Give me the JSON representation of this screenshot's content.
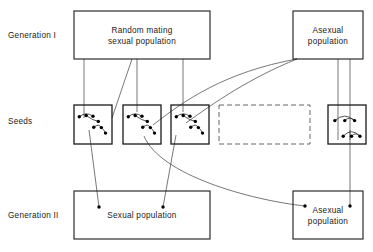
{
  "diagram": {
    "row_labels": [
      {
        "id": "generation-i",
        "text": "Generation I",
        "x": 8,
        "y": 38
      },
      {
        "id": "seeds",
        "text": "Seeds",
        "x": 8,
        "y": 124
      },
      {
        "id": "generation-ii",
        "text": "Generation II",
        "x": 8,
        "y": 218
      }
    ],
    "boxes": [
      {
        "id": "random-mating-sexual-population",
        "x": 74,
        "y": 11,
        "w": 136,
        "h": 48,
        "lines": [
          "Random mating",
          "sexual population"
        ],
        "style": "solid"
      },
      {
        "id": "asexual-population-gen1",
        "x": 293,
        "y": 11,
        "w": 70,
        "h": 48,
        "lines": [
          "Asexual",
          "population"
        ],
        "style": "solid"
      },
      {
        "id": "empty-seed-placeholder",
        "x": 219,
        "y": 105,
        "w": 91,
        "h": 39,
        "lines": [],
        "style": "dashed"
      },
      {
        "id": "sexual-population-gen2",
        "x": 74,
        "y": 191,
        "w": 136,
        "h": 48,
        "lines": [
          "Sexual population"
        ],
        "style": "solid"
      },
      {
        "id": "asexual-population-gen2",
        "x": 293,
        "y": 191,
        "w": 70,
        "h": 48,
        "lines": [
          "Asexual",
          "population"
        ],
        "style": "solid"
      }
    ],
    "seed_boxes": [
      {
        "id": "seed-box-1",
        "x": 74,
        "y": 105,
        "w": 38,
        "h": 39,
        "pattern": "sexual"
      },
      {
        "id": "seed-box-2",
        "x": 123,
        "y": 105,
        "w": 38,
        "h": 39,
        "pattern": "sexual"
      },
      {
        "id": "seed-box-3",
        "x": 171,
        "y": 105,
        "w": 38,
        "h": 39,
        "pattern": "sexual"
      },
      {
        "id": "seed-box-4",
        "x": 328,
        "y": 105,
        "w": 38,
        "h": 39,
        "pattern": "asexual"
      }
    ],
    "seed_patterns": {
      "sexual": {
        "dots": [
          [
            0.14,
            0.3
          ],
          [
            0.32,
            0.27
          ],
          [
            0.5,
            0.29
          ],
          [
            0.64,
            0.42
          ],
          [
            0.52,
            0.57
          ],
          [
            0.72,
            0.58
          ],
          [
            0.83,
            0.72
          ]
        ],
        "branches": [
          [
            [
              0.14,
              0.3
            ],
            [
              0.32,
              0.16
            ],
            [
              0.5,
              0.29
            ]
          ],
          [
            [
              0.32,
              0.27
            ],
            [
              0.5,
              0.4
            ],
            [
              0.64,
              0.42
            ]
          ],
          [
            [
              0.52,
              0.57
            ],
            [
              0.66,
              0.46
            ],
            [
              0.72,
              0.58
            ]
          ],
          [
            [
              0.72,
              0.58
            ],
            [
              0.8,
              0.64
            ],
            [
              0.83,
              0.72
            ]
          ]
        ]
      },
      "asexual": {
        "dots": [
          [
            0.18,
            0.4
          ],
          [
            0.44,
            0.4
          ],
          [
            0.7,
            0.4
          ],
          [
            0.4,
            0.8
          ],
          [
            0.62,
            0.8
          ],
          [
            0.84,
            0.8
          ]
        ],
        "branches": [
          [
            [
              0.18,
              0.4
            ],
            [
              0.44,
              0.17
            ],
            [
              0.7,
              0.4
            ]
          ],
          [
            [
              0.44,
              0.4
            ],
            [
              0.57,
              0.28
            ],
            [
              0.7,
              0.4
            ]
          ],
          [
            [
              0.4,
              0.8
            ],
            [
              0.62,
              0.57
            ],
            [
              0.84,
              0.8
            ]
          ],
          [
            [
              0.62,
              0.8
            ],
            [
              0.73,
              0.68
            ],
            [
              0.84,
              0.8
            ]
          ]
        ]
      }
    },
    "connectors": [
      {
        "id": "gen1-sexual-to-seed1",
        "kind": "line",
        "from": [
          84,
          59
        ],
        "to": [
          84,
          118
        ]
      },
      {
        "id": "gen1-sexual-to-seed2-diagonal",
        "kind": "line",
        "from": [
          132,
          59
        ],
        "to": [
          112,
          118
        ]
      },
      {
        "id": "gen1-sexual-to-seed2",
        "kind": "line",
        "from": [
          137,
          59
        ],
        "to": [
          137,
          112
        ]
      },
      {
        "id": "gen1-sexual-to-seed3",
        "kind": "line",
        "from": [
          183,
          59
        ],
        "to": [
          183,
          112
        ]
      },
      {
        "id": "gen1-asexual-to-seed2-curve",
        "kind": "curve",
        "from": [
          297,
          59
        ],
        "c1": [
          225,
          72
        ],
        "c2": [
          185,
          100
        ],
        "to": [
          153,
          125
        ]
      },
      {
        "id": "gen1-asexual-to-seed3-curve",
        "kind": "curve",
        "from": [
          297,
          59
        ],
        "c1": [
          250,
          78
        ],
        "c2": [
          215,
          102
        ],
        "to": [
          186,
          123
        ]
      },
      {
        "id": "gen1-asexual-to-seed4-left",
        "kind": "line",
        "from": [
          338,
          59
        ],
        "to": [
          338,
          140
        ]
      },
      {
        "id": "gen1-asexual-to-seed4-right",
        "kind": "line",
        "from": [
          350,
          59
        ],
        "to": [
          350,
          140
        ]
      },
      {
        "id": "seed1-to-gen2-sexual",
        "kind": "line",
        "from": [
          89,
          130
        ],
        "to": [
          99,
          207
        ]
      },
      {
        "id": "seed3-to-gen2-sexual",
        "kind": "line",
        "from": [
          176,
          135
        ],
        "to": [
          163,
          207
        ]
      },
      {
        "id": "seed2-to-gen2-asexual-curve",
        "kind": "curve",
        "from": [
          144,
          136
        ],
        "c1": [
          160,
          175
        ],
        "c2": [
          250,
          200
        ],
        "to": [
          305,
          206
        ]
      },
      {
        "id": "seed4-to-gen2-asexual",
        "kind": "line",
        "from": [
          350,
          130
        ],
        "to": [
          350,
          207
        ]
      }
    ],
    "end_dots": [
      {
        "id": "end-dot-gen2-sexual-a",
        "x": 99,
        "y": 207
      },
      {
        "id": "end-dot-gen2-sexual-b",
        "x": 163,
        "y": 207
      },
      {
        "id": "end-dot-gen2-asexual-a",
        "x": 305,
        "y": 206
      },
      {
        "id": "end-dot-gen2-asexual-b",
        "x": 350,
        "y": 206
      }
    ],
    "colors": {
      "stroke": "#1a1a1a",
      "connector": "#4a4a4a",
      "dashed": "#555555",
      "background": "#ffffff"
    }
  }
}
